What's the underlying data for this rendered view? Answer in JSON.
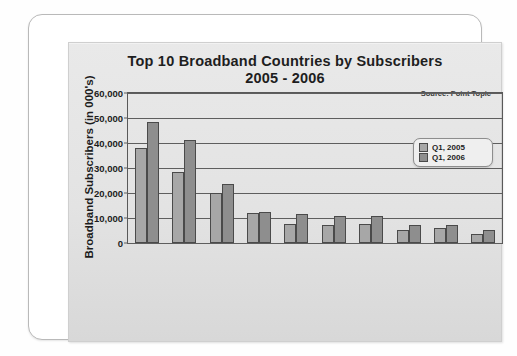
{
  "chart_data": {
    "type": "bar",
    "title": "Top 10 Broadband Countries by Subscribers",
    "subtitle": "2005 - 2006",
    "xlabel": "",
    "ylabel": "Broadband Subscribers (in 000's)",
    "ylim": [
      0,
      60000
    ],
    "yticks": [
      "0",
      "10,000",
      "20,000",
      "30,000",
      "40,000",
      "50,000",
      "60,000"
    ],
    "ytick_values": [
      0,
      10000,
      20000,
      30000,
      40000,
      50000,
      60000
    ],
    "grid": true,
    "legend_position": "top-right",
    "source_note": "Source: Point Topic",
    "categories": [
      "USA",
      "China",
      "Japan",
      "South Korea",
      "Germany",
      "UK",
      "France",
      "Italy",
      "Canada",
      "Spain"
    ],
    "series": [
      {
        "name": "Q1, 2005",
        "color": "#a7a7a7",
        "values": [
          38004,
          28307,
          19838,
          12087,
          7536,
          7116,
          7669,
          5208,
          5889,
          3736
        ],
        "labels": [
          "38,004",
          "28,307",
          "19,838",
          "12,087",
          "7,536",
          "7,116",
          "7,669",
          "5,208",
          "5,889",
          "3,736"
        ]
      },
      {
        "name": "Q1, 2006",
        "color": "#8e8e8e",
        "values": [
          48311,
          41196,
          23701,
          12459,
          11449,
          10833,
          10821,
          7394,
          7105,
          5322
        ],
        "labels": [
          "48,311",
          "41,196",
          "23,701",
          "12,459",
          "11,449",
          "10,833",
          "10,821",
          "7,394",
          "7,105",
          "5,322"
        ]
      }
    ],
    "growth": {
      "name": "Growth",
      "labels": [
        "27%",
        "46%",
        "19%",
        "3%",
        "52%",
        "52%",
        "41%",
        "42%",
        "21%",
        "42%"
      ]
    }
  }
}
